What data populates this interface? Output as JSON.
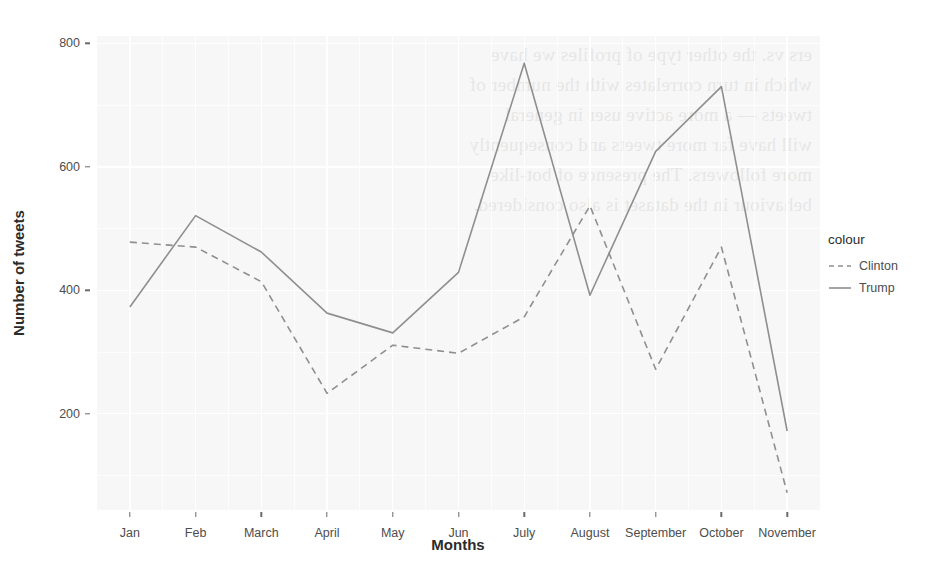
{
  "chart_data": {
    "type": "line",
    "title": "",
    "xlabel": "Months",
    "ylabel": "Number of tweets",
    "categories": [
      "Jan",
      "Feb",
      "March",
      "April",
      "May",
      "Jun",
      "July",
      "August",
      "September",
      "October",
      "November"
    ],
    "series": [
      {
        "name": "Clinton",
        "style": "dashed",
        "color": "#8f8f8f",
        "values": [
          478,
          470,
          414,
          233,
          311,
          298,
          357,
          537,
          272,
          470,
          72
        ]
      },
      {
        "name": "Trump",
        "style": "solid",
        "color": "#8f8f8f",
        "values": [
          373,
          521,
          462,
          363,
          331,
          429,
          768,
          392,
          625,
          730,
          172
        ]
      }
    ],
    "ylim": [
      44,
      812
    ],
    "yticks": [
      200,
      400,
      600,
      800
    ],
    "ytick_labels": [
      "200",
      "400",
      "600",
      "800"
    ],
    "grid": true,
    "legend_position": "right",
    "legend_title": "colour",
    "panel_background": "#f7f7f7",
    "grid_color": "#ffffff"
  },
  "legend": {
    "title": "colour",
    "entries": [
      {
        "label": "Clinton",
        "style": "dashed"
      },
      {
        "label": "Trump",
        "style": "solid"
      }
    ]
  },
  "axes": {
    "y_title": "Number of tweets",
    "x_title": "Months"
  },
  "background_text": "ers vs. the other type of profiles we have\nwhich in turn correlates with the number of\ntweets — a more active user in general\nwill have far more tweets and consequently\nmore followers. The presence of bot-like\nbehaviour in the dataset is also considered."
}
